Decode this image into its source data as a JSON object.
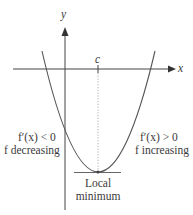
{
  "diagram": {
    "axes": {
      "x_label": "x",
      "y_label": "y",
      "critical_point_label": "c"
    },
    "left_annotation": {
      "line1": "f′(x) < 0",
      "line2": "f decreasing"
    },
    "right_annotation": {
      "line1": "f′(x) > 0",
      "line2": "f increasing"
    },
    "minimum_annotation": {
      "line1": "Local",
      "line2": "minimum"
    },
    "colors": {
      "curve": "#555555",
      "axis": "#444444",
      "dotted": "#999999",
      "text": "#3a3a3a"
    }
  }
}
